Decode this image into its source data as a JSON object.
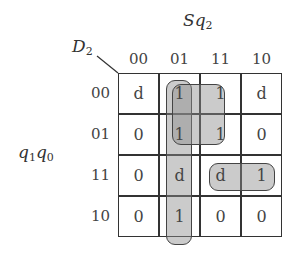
{
  "kmap": {
    "output_label": "D",
    "output_sub": "2",
    "col_var_main": "Sq",
    "col_var_sub": "2",
    "row_var_a": "q",
    "row_var_a_sub": "1",
    "row_var_b": "q",
    "row_var_b_sub": "0",
    "col_headers": [
      "00",
      "01",
      "11",
      "10"
    ],
    "row_headers": [
      "00",
      "01",
      "11",
      "10"
    ],
    "cells": [
      [
        "d",
        "1",
        "1",
        "d"
      ],
      [
        "0",
        "1",
        "1",
        "0"
      ],
      [
        "0",
        "d",
        "d",
        "1"
      ],
      [
        "0",
        "1",
        "0",
        "0"
      ]
    ],
    "groupings": [
      {
        "name": "column-01-group",
        "cells": "rows 00-10, col 01"
      },
      {
        "name": "square-group",
        "cells": "rows 00-01, cols 01-11"
      },
      {
        "name": "row-11-pair-group",
        "cells": "row 11, cols 11-10"
      }
    ],
    "colors": {
      "line": "#333333",
      "loop_fill": "#a6a6a6"
    }
  }
}
